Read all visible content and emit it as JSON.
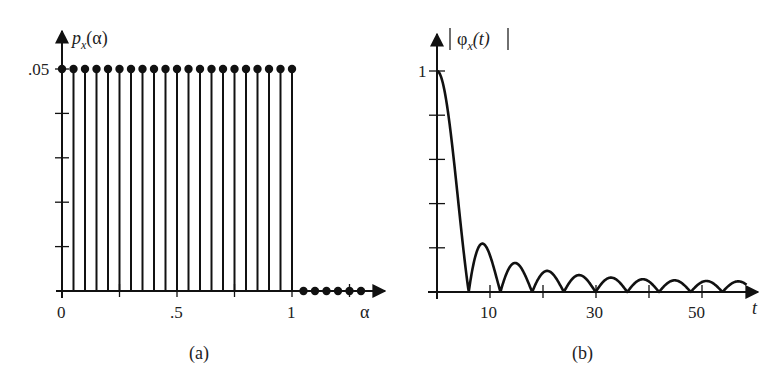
{
  "chart_data": [
    {
      "id": "a",
      "type": "stem",
      "caption": "(a)",
      "title": "",
      "ylabel": "p_x(α)",
      "ylabel_main": "p",
      "ylabel_sub": "x",
      "ylabel_arg": "(α)",
      "xlabel": "α",
      "xlim": [
        0,
        1.35
      ],
      "ylim": [
        0,
        0.05
      ],
      "x_tick_labels": [
        {
          "value": 0,
          "label": "0"
        },
        {
          "value": 0.5,
          "label": ".5"
        },
        {
          "value": 1,
          "label": "1"
        }
      ],
      "x_ticks": [
        0,
        0.25,
        0.5,
        0.75,
        1,
        1.25
      ],
      "y_tick_labels": [
        {
          "value": 0.05,
          "label": ".05"
        }
      ],
      "y_ticks": [
        0.01,
        0.02,
        0.03,
        0.04,
        0.05
      ],
      "grid": false,
      "x": [
        0,
        0.05,
        0.1,
        0.15,
        0.2,
        0.25,
        0.3,
        0.35,
        0.4,
        0.45,
        0.5,
        0.55,
        0.6,
        0.65,
        0.7,
        0.75,
        0.8,
        0.85,
        0.9,
        0.95,
        1.0,
        1.05,
        1.1,
        1.15,
        1.2,
        1.25,
        1.3
      ],
      "values": [
        0.05,
        0.05,
        0.05,
        0.05,
        0.05,
        0.05,
        0.05,
        0.05,
        0.05,
        0.05,
        0.05,
        0.05,
        0.05,
        0.05,
        0.05,
        0.05,
        0.05,
        0.05,
        0.05,
        0.05,
        0.05,
        0,
        0,
        0,
        0,
        0,
        0
      ]
    },
    {
      "id": "b",
      "type": "line",
      "caption": "(b)",
      "title": "",
      "ylabel": "|φ_x(t)|",
      "ylabel_main": "φ",
      "ylabel_sub": "x",
      "ylabel_arg": "(t)",
      "xlabel": "t",
      "xlim": [
        0,
        60
      ],
      "ylim": [
        0,
        1
      ],
      "x_tick_labels": [
        {
          "value": 10,
          "label": "10"
        },
        {
          "value": 30,
          "label": "30"
        },
        {
          "value": 50,
          "label": "50"
        }
      ],
      "x_ticks": [
        10,
        20,
        30,
        40,
        50
      ],
      "y_tick_labels": [
        {
          "value": 1,
          "label": "1"
        }
      ],
      "y_ticks": [
        0.2,
        0.4,
        0.6,
        0.8,
        1.0
      ],
      "grid": false,
      "function": "|sin(N·Δ·t/2) / (N·sin(Δ·t/2))|",
      "params": {
        "N": 21,
        "delta": 0.05
      },
      "x": [
        0,
        3,
        6,
        9,
        12,
        15,
        18,
        21,
        24,
        27,
        30,
        33,
        36,
        39,
        42,
        45,
        48,
        51,
        54,
        57
      ],
      "values": [
        1.0,
        0.63,
        0.0,
        0.22,
        0.0,
        0.13,
        0.0,
        0.09,
        0.0,
        0.075,
        0.0,
        0.065,
        0.0,
        0.06,
        0.0,
        0.055,
        0.0,
        0.055,
        0.0,
        0.055
      ]
    }
  ]
}
